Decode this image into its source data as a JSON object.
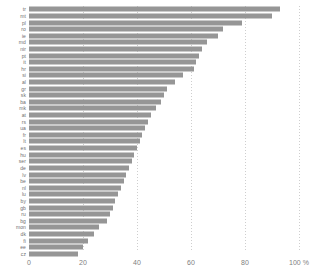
{
  "chart_data": {
    "type": "bar",
    "orientation": "horizontal",
    "title": "",
    "xlabel": "",
    "ylabel": "",
    "xlim": [
      0,
      100
    ],
    "xticks": [
      0,
      20,
      40,
      60,
      80,
      100
    ],
    "xtick_labels": [
      "0",
      "20",
      "40",
      "60",
      "80",
      "100 %"
    ],
    "grid": true,
    "grid_axis": "x",
    "legend": false,
    "bar_color": "#969696",
    "categories": [
      "tr",
      "mt",
      "pl",
      "ro",
      "ie",
      "md",
      "nir",
      "pt",
      "it",
      "hr",
      "si",
      "al",
      "gr",
      "sk",
      "ba",
      "mk",
      "at",
      "rs",
      "ua",
      "fr",
      "lt",
      "es",
      "hu",
      "ser",
      "de",
      "lv",
      "be",
      "nl",
      "lu",
      "by",
      "gb",
      "ru",
      "bg",
      "mon",
      "dk",
      "fi",
      "ee",
      "cz"
    ],
    "values": [
      93,
      90,
      79,
      72,
      70,
      66,
      64,
      63,
      62,
      61,
      57,
      54,
      51,
      50,
      49,
      47,
      45,
      44,
      43,
      42,
      41,
      40,
      39,
      38,
      37,
      36,
      35,
      34,
      33,
      32,
      31,
      30,
      29,
      26,
      24,
      22,
      20,
      18
    ]
  },
  "axis": {
    "unit_label": "%"
  }
}
